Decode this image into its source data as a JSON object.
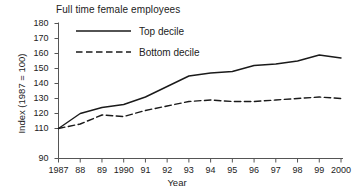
{
  "chart_data": {
    "type": "line",
    "title": "Full time female employees",
    "xlabel": "Year",
    "ylabel": "Index (1987 = 100)",
    "x": [
      1987,
      1988,
      1989,
      1990,
      1991,
      1992,
      1993,
      1994,
      1995,
      1996,
      1997,
      1998,
      1999,
      2000
    ],
    "categories": [
      "1987",
      "88",
      "89",
      "1990",
      "91",
      "92",
      "93",
      "94",
      "95",
      "96",
      "97",
      "98",
      "99",
      "2000"
    ],
    "series": [
      {
        "name": "Top decile",
        "style": "solid",
        "color": "#1a1a1a",
        "values": [
          110,
          120,
          124,
          126,
          131,
          138,
          145,
          147,
          148,
          152,
          153,
          155,
          159,
          157
        ]
      },
      {
        "name": "Bottom decile",
        "style": "dashed",
        "color": "#1a1a1a",
        "values": [
          110,
          113,
          119,
          118,
          122,
          125,
          128,
          129,
          128,
          128,
          129,
          130,
          131,
          130
        ]
      }
    ],
    "ylim": [
      90,
      180
    ],
    "ytick_values": [
      90,
      110,
      120,
      130,
      140,
      150,
      160,
      170,
      180
    ],
    "ytick_labels": [
      "90",
      "110",
      "120",
      "130",
      "140",
      "150",
      "160",
      "170",
      "180"
    ],
    "grid": false,
    "legend_position": "top-left-inside"
  },
  "legend": {
    "entries": [
      {
        "label": "Top decile"
      },
      {
        "label": "Bottom decile"
      }
    ]
  }
}
